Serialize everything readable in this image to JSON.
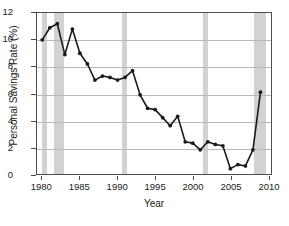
{
  "chart_data": {
    "type": "line",
    "title": "",
    "xlabel": "Year",
    "ylabel": "Personal Savings Rate (%)",
    "xlim": [
      1979.3,
      2010.4
    ],
    "ylim": [
      0,
      12
    ],
    "grid": true,
    "legend": "none",
    "marker": "circle",
    "line_color": "#1a1a1a",
    "band_color": "#d2d2d2",
    "x": [
      1980,
      1981,
      1982,
      1983,
      1984,
      1985,
      1986,
      1987,
      1988,
      1989,
      1990,
      1991,
      1992,
      1993,
      1994,
      1995,
      1996,
      1997,
      1998,
      1999,
      2000,
      2001,
      2002,
      2003,
      2004,
      2005,
      2006,
      2007,
      2008,
      2009
    ],
    "values": [
      10.0,
      10.9,
      11.2,
      8.9,
      10.8,
      9.0,
      8.2,
      7.0,
      7.3,
      7.2,
      7.0,
      7.2,
      7.7,
      5.9,
      4.9,
      4.8,
      4.2,
      3.6,
      4.3,
      2.4,
      2.3,
      1.8,
      2.4,
      2.2,
      2.1,
      0.4,
      0.7,
      0.6,
      1.8,
      6.1
    ],
    "xticks": [
      1980,
      1985,
      1990,
      1995,
      2000,
      2005,
      2010
    ],
    "xtick_labels": [
      "1980",
      "1985",
      "1990",
      "1995",
      "2000",
      "2005",
      "2010"
    ],
    "yticks": [
      0,
      2,
      4,
      6,
      8,
      10,
      12
    ],
    "ytick_labels": [
      "0",
      "2",
      "4",
      "6",
      "8",
      "10",
      "12"
    ],
    "shaded_bands": [
      {
        "label": "recession-1980",
        "start": 1980.0,
        "end": 1980.6
      },
      {
        "label": "recession-1981-1982",
        "start": 1981.5,
        "end": 1982.9
      },
      {
        "label": "recession-1990-1991",
        "start": 1990.5,
        "end": 1991.2
      },
      {
        "label": "recession-2001",
        "start": 2001.2,
        "end": 2001.9
      },
      {
        "label": "recession-2007-2009",
        "start": 2007.9,
        "end": 2009.5
      }
    ]
  }
}
